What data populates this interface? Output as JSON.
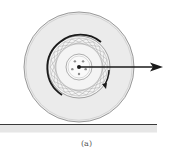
{
  "figure": {
    "caption": "(a)",
    "colors": {
      "tire_fill": "#ebebeb",
      "tire_outline": "#9a9a9a",
      "rim_fill": "#f4f4f4",
      "spokes": "#a8a8a8",
      "rim_dark_arc": "#1a1a1a",
      "hub_outline": "#9a9a9a",
      "bolts": "#8a8a8a",
      "arrow": "#1a1a1a",
      "ground_line": "#3a3a3a",
      "ground_fill": "#e6e6e6"
    },
    "wheel": {
      "center": [
        79,
        67
      ],
      "tire_radius": 55,
      "rim_radius": 31,
      "hub_radius": 13,
      "bolt_count": 5,
      "bolt_circle_radius": 7,
      "spoke_count": 24
    },
    "arrow": {
      "label": "velocity",
      "from": [
        79,
        67
      ],
      "to": [
        163,
        67
      ]
    },
    "ground": {
      "y": 124,
      "x_start": 0,
      "x_end": 157
    }
  }
}
